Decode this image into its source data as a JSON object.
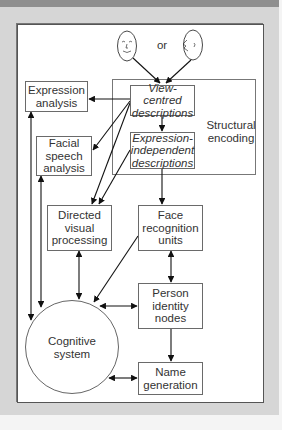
{
  "diagram": {
    "input": {
      "face_front": "front-face",
      "face_profile": "profile-face",
      "connector": "or"
    },
    "nodes": {
      "structural_encoding": "Structural encoding",
      "view_centred": "View-centred descriptions",
      "expression_independent": "Expression-independent descriptions",
      "expression_analysis": "Expression analysis",
      "facial_speech": "Facial speech analysis",
      "directed_visual": "Directed visual processing",
      "face_recognition_units": "Face recognition units",
      "person_identity_nodes": "Person identity nodes",
      "name_generation": "Name generation",
      "cognitive_system": "Cognitive system"
    },
    "labels": {
      "view_centred_l1": "View-centred",
      "view_centred_l2": "descriptions",
      "expr_indep_l1": "Expression-",
      "expr_indep_l2": "independent",
      "expr_indep_l3": "descriptions",
      "structural_l1": "Structural",
      "structural_l2": "encoding",
      "expression_l1": "Expression",
      "expression_l2": "analysis",
      "facial_l1": "Facial",
      "facial_l2": "speech",
      "facial_l3": "analysis",
      "directed_l1": "Directed",
      "directed_l2": "visual",
      "directed_l3": "processing",
      "fru_l1": "Face",
      "fru_l2": "recognition",
      "fru_l3": "units",
      "pin_l1": "Person",
      "pin_l2": "identity",
      "pin_l3": "nodes",
      "name_l1": "Name",
      "name_l2": "generation",
      "cog_l1": "Cognitive",
      "cog_l2": "system"
    },
    "edges": [
      {
        "from": "face_front",
        "to": "view_centred",
        "type": "arrow"
      },
      {
        "from": "face_profile",
        "to": "view_centred",
        "type": "arrow"
      },
      {
        "from": "view_centred",
        "to": "expression_independent",
        "type": "arrow"
      },
      {
        "from": "view_centred",
        "to": "expression_analysis",
        "type": "arrow"
      },
      {
        "from": "view_centred",
        "to": "facial_speech",
        "type": "arrow"
      },
      {
        "from": "view_centred",
        "to": "directed_visual",
        "type": "arrow"
      },
      {
        "from": "expression_independent",
        "to": "directed_visual",
        "type": "arrow"
      },
      {
        "from": "expression_independent",
        "to": "face_recognition_units",
        "type": "arrow"
      },
      {
        "from": "expression_analysis",
        "to": "cognitive_system",
        "type": "double"
      },
      {
        "from": "facial_speech",
        "to": "cognitive_system",
        "type": "double"
      },
      {
        "from": "directed_visual",
        "to": "cognitive_system",
        "type": "double"
      },
      {
        "from": "face_recognition_units",
        "to": "cognitive_system",
        "type": "arrow"
      },
      {
        "from": "face_recognition_units",
        "to": "person_identity_nodes",
        "type": "double"
      },
      {
        "from": "person_identity_nodes",
        "to": "cognitive_system",
        "type": "double"
      },
      {
        "from": "person_identity_nodes",
        "to": "name_generation",
        "type": "arrow"
      },
      {
        "from": "name_generation",
        "to": "cognitive_system",
        "type": "double"
      }
    ]
  }
}
